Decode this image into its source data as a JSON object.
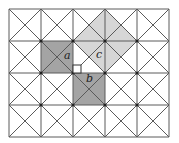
{
  "diagram": {
    "type": "pythagorean-grid",
    "grid": {
      "cols": 5,
      "rows": 4,
      "origin": [
        9,
        9
      ],
      "cell": 32,
      "diagonals": true,
      "dots_at_vertices": true
    },
    "colors": {
      "line": "#5a5a5a",
      "square_ab_fill": "#a4a4a4",
      "square_c_fill": "#d6d6d6",
      "background": "#ffffff",
      "dot": "#222222"
    },
    "shapes": {
      "square_a": {
        "label": "a",
        "points": [
          [
            41,
            41
          ],
          [
            73,
            41
          ],
          [
            73,
            73
          ],
          [
            41,
            73
          ]
        ]
      },
      "square_b": {
        "label": "b",
        "points": [
          [
            73,
            73
          ],
          [
            105,
            73
          ],
          [
            105,
            105
          ],
          [
            73,
            105
          ]
        ]
      },
      "square_c": {
        "label": "c",
        "points": [
          [
            105,
            9
          ],
          [
            137,
            41
          ],
          [
            105,
            73
          ],
          [
            73,
            41
          ]
        ]
      },
      "right_triangle": {
        "points": [
          [
            73,
            41
          ],
          [
            73,
            73
          ],
          [
            105,
            73
          ]
        ]
      }
    },
    "labels": {
      "a": "a",
      "b": "b",
      "c": "c"
    }
  }
}
